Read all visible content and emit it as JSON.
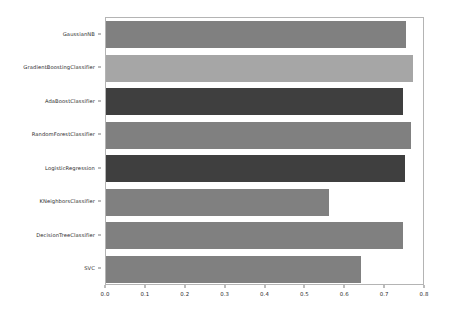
{
  "chart_data": {
    "type": "bar",
    "orientation": "horizontal",
    "title": "",
    "xlabel": "",
    "ylabel": "",
    "xlim": [
      0.0,
      0.8
    ],
    "ylim": [
      0,
      8
    ],
    "grid": false,
    "legend": null,
    "xticks": [
      "0.0",
      "0.1",
      "0.2",
      "0.3",
      "0.4",
      "0.5",
      "0.6",
      "0.7",
      "0.8"
    ],
    "xtick_values": [
      0.0,
      0.1,
      0.2,
      0.3,
      0.4,
      0.5,
      0.6,
      0.7,
      0.8
    ],
    "categories": [
      "GaussianNB",
      "GradientBoostingClassifier",
      "AdaBoostClassifier",
      "RandomForestClassifier",
      "LogisticRegression",
      "KNeighborsClassifier",
      "DecisionTreeClassifier",
      "SVC"
    ],
    "values": [
      0.752,
      0.77,
      0.745,
      0.765,
      0.75,
      0.56,
      0.745,
      0.64
    ],
    "bar_colors": [
      "#808080",
      "#a6a6a6",
      "#3f3f3f",
      "#808080",
      "#3f3f3f",
      "#808080",
      "#808080",
      "#808080"
    ]
  },
  "figure": {
    "background_color": "#ffffff",
    "axes_edge_color": "#b4b4b4",
    "tick_color": "#7a7a7a",
    "tick_label_color": "#2b2b2b"
  }
}
